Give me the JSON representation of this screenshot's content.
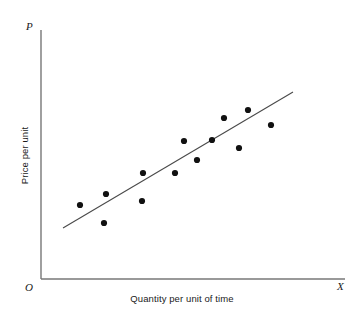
{
  "chart_data": {
    "type": "scatter",
    "title": "",
    "subtitle": "",
    "xlabel": "Quantity per unit of time",
    "ylabel": "Price per unit",
    "x_axis_letter": "X",
    "y_axis_letter": "P",
    "origin_letter": "O",
    "grid": false,
    "legend": null,
    "xlim": [
      0,
      100
    ],
    "ylim": [
      0,
      100
    ],
    "point_color": "#111111",
    "line_color": "#4a4a4a",
    "axis_color": "#777777",
    "point_radius_px": 3.1,
    "points": [
      {
        "x": 12.8,
        "y": 29.5
      },
      {
        "x": 21.4,
        "y": 34.0
      },
      {
        "x": 20.7,
        "y": 22.3
      },
      {
        "x": 33.6,
        "y": 42.3
      },
      {
        "x": 44.1,
        "y": 42.3
      },
      {
        "x": 51.3,
        "y": 47.6
      },
      {
        "x": 47.0,
        "y": 55.2
      },
      {
        "x": 56.2,
        "y": 55.6
      },
      {
        "x": 60.2,
        "y": 64.5
      },
      {
        "x": 68.1,
        "y": 67.7
      },
      {
        "x": 75.7,
        "y": 62.1
      },
      {
        "x": 65.1,
        "y": 52.6
      },
      {
        "x": 43.4,
        "y": 31.0
      }
    ],
    "points_px": [
      {
        "x": 80,
        "y": 205
      },
      {
        "x": 106,
        "y": 194
      },
      {
        "x": 104,
        "y": 223
      },
      {
        "x": 143,
        "y": 173
      },
      {
        "x": 175,
        "y": 173
      },
      {
        "x": 197,
        "y": 160
      },
      {
        "x": 184,
        "y": 141
      },
      {
        "x": 212,
        "y": 140
      },
      {
        "x": 224,
        "y": 118
      },
      {
        "x": 248,
        "y": 110
      },
      {
        "x": 271,
        "y": 125
      },
      {
        "x": 239,
        "y": 148
      },
      {
        "x": 142,
        "y": 201
      }
    ],
    "trendline": {
      "name": "regression-line",
      "x1_px": 63,
      "y1_px": 228,
      "x2_px": 293,
      "y2_px": 92
    },
    "axes_px": {
      "y_axis": {
        "x": 41,
        "y_top": 30,
        "y_bottom": 279
      },
      "x_axis": {
        "y": 279,
        "x_left": 41,
        "x_right": 345
      }
    }
  }
}
